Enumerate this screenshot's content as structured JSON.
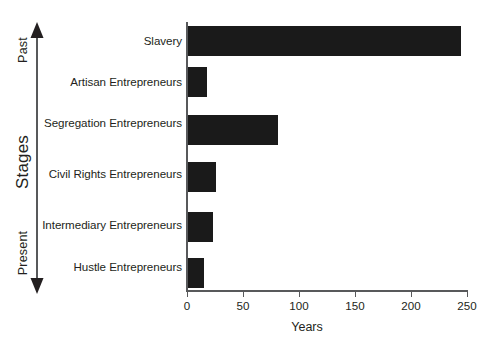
{
  "chart_data": {
    "type": "bar",
    "orientation": "horizontal",
    "title": "",
    "xlabel": "Years",
    "ylabel": "Stages",
    "categories": [
      "Slavery",
      "Artisan Entrepreneurs",
      "Segregation Entrepreneurs",
      "Civil Rights Entrepreneurs",
      "Intermediary Entrepreneurs",
      "Hustle Entrepreneurs"
    ],
    "values": [
      245,
      18,
      81,
      26,
      23,
      15
    ],
    "xlim": [
      0,
      250
    ],
    "xticks": [
      0,
      50,
      100,
      150,
      200,
      250
    ],
    "xticklabels": [
      "0",
      "50",
      "100",
      "150",
      "200",
      "250"
    ],
    "grid": false,
    "legend": null,
    "bar_color": "#1a1a1a",
    "axis_color": "#58595b",
    "text_color": "#231f20",
    "axis_annotations": {
      "top": "Past",
      "middle": "Stages",
      "bottom": "Present"
    }
  }
}
